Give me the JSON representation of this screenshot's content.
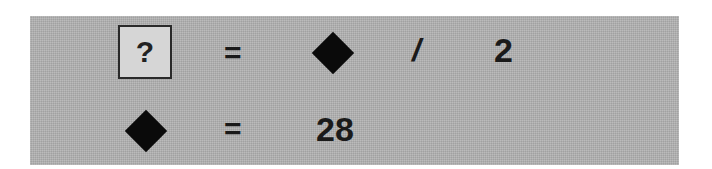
{
  "puzzle": {
    "row1": {
      "unknown": "?",
      "equals": "=",
      "operator": "/",
      "operand": "2",
      "symbol": "diamond"
    },
    "row2": {
      "symbol": "diamond",
      "equals": "=",
      "value": "28"
    }
  },
  "colors": {
    "panel_bg": "#b3b3b3",
    "unknown_box_bg": "#d6d6d6",
    "glyph": "#1a1a1a"
  }
}
